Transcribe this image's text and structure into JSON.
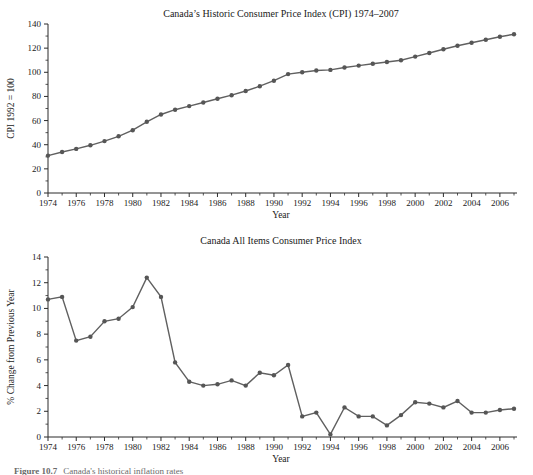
{
  "colors": {
    "background": "#ffffff",
    "line": "#606060",
    "marker": "#565656",
    "axis": "#2b2b2b",
    "text": "#1a1a1a"
  },
  "caption": {
    "label": "Figure 10.7",
    "text": "Canada's historical inflation rates"
  },
  "chart_data": [
    {
      "name": "cpi-level",
      "type": "line",
      "title": "Canada’s Historic Consumer Price Index (CPI) 1974–2007",
      "xlabel": "Year",
      "ylabel": "CPI 1992 = 100",
      "ylim": [
        0,
        140
      ],
      "yticks": [
        0,
        20,
        40,
        60,
        80,
        100,
        120,
        140
      ],
      "yticks_minor": [
        10,
        30,
        50,
        70,
        90,
        110,
        130
      ],
      "xtick_labels": [
        1974,
        1976,
        1978,
        1980,
        1982,
        1984,
        1986,
        1988,
        1990,
        1992,
        1994,
        1996,
        1998,
        2000,
        2002,
        2004,
        2006
      ],
      "x": [
        1974,
        1975,
        1976,
        1977,
        1978,
        1979,
        1980,
        1981,
        1982,
        1983,
        1984,
        1985,
        1986,
        1987,
        1988,
        1989,
        1990,
        1991,
        1992,
        1993,
        1994,
        1995,
        1996,
        1997,
        1998,
        1999,
        2000,
        2001,
        2002,
        2003,
        2004,
        2005,
        2006,
        2007
      ],
      "values": [
        31.0,
        34.0,
        36.5,
        39.5,
        43.0,
        47.0,
        52.0,
        59.0,
        65.0,
        69.0,
        72.0,
        75.0,
        78.0,
        81.0,
        84.5,
        88.5,
        93.0,
        98.5,
        100.0,
        101.5,
        102.0,
        104.0,
        105.5,
        107.0,
        108.5,
        110.0,
        113.0,
        116.0,
        119.0,
        122.0,
        124.5,
        127.0,
        129.5,
        131.5
      ],
      "grid": false,
      "legend": "none",
      "marker": "circle"
    },
    {
      "name": "cpi-inflation",
      "type": "line",
      "title": "Canada All Items Consumer Price Index",
      "xlabel": "Year",
      "ylabel": "% Change from Previous Year",
      "ylim": [
        0,
        14
      ],
      "yticks": [
        0,
        2,
        4,
        6,
        8,
        10,
        12,
        14
      ],
      "yticks_minor": [
        1,
        3,
        5,
        7,
        9,
        11,
        13
      ],
      "xtick_labels": [
        1974,
        1976,
        1978,
        1980,
        1982,
        1984,
        1986,
        1988,
        1990,
        1992,
        1994,
        1996,
        1998,
        2000,
        2002,
        2004,
        2006
      ],
      "x": [
        1974,
        1975,
        1976,
        1977,
        1978,
        1979,
        1980,
        1981,
        1982,
        1983,
        1984,
        1985,
        1986,
        1987,
        1988,
        1989,
        1990,
        1991,
        1992,
        1993,
        1994,
        1995,
        1996,
        1997,
        1998,
        1999,
        2000,
        2001,
        2002,
        2003,
        2004,
        2005,
        2006,
        2007
      ],
      "values": [
        10.7,
        10.9,
        7.5,
        7.8,
        9.0,
        9.2,
        10.1,
        12.4,
        10.9,
        5.8,
        4.3,
        4.0,
        4.1,
        4.4,
        4.0,
        5.0,
        4.8,
        5.6,
        1.6,
        1.9,
        0.2,
        2.3,
        1.6,
        1.6,
        0.9,
        1.7,
        2.7,
        2.6,
        2.3,
        2.8,
        1.9,
        1.9,
        2.1,
        2.2
      ],
      "grid": false,
      "legend": "none",
      "marker": "circle"
    }
  ]
}
